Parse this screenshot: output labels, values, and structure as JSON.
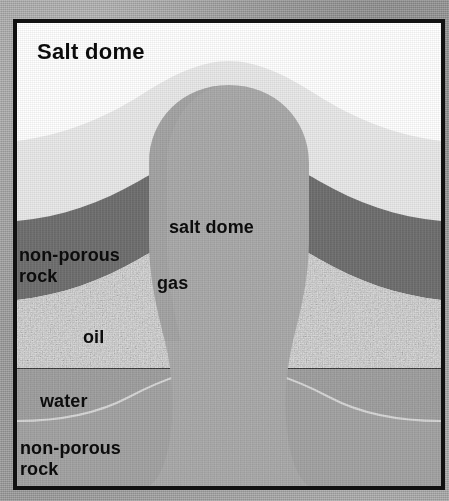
{
  "figure": {
    "title": "Salt dome",
    "caption_position": "top-left-inside-frame",
    "frame_border_color": "#111111",
    "outer_background_color": "#9a9a9a",
    "type": "geological-cross-section"
  },
  "labels": {
    "title": "Salt dome",
    "salt_dome": "salt dome",
    "gas": "gas",
    "oil": "oil",
    "water": "water",
    "non_porous_rock_upper": "non-porous\nrock",
    "non_porous_rock_lower": "non-porous\nrock"
  },
  "strata": [
    {
      "name": "overburden-white",
      "label": "",
      "color": "#ffffff",
      "texture": "smooth",
      "order": 1
    },
    {
      "name": "caprock-light",
      "label": "",
      "color": "#e8e8e8",
      "texture": "smooth",
      "order": 2
    },
    {
      "name": "non-porous-rock-upper",
      "label": "non-porous rock",
      "color": "#6e6e6e",
      "texture": "smooth",
      "order": 3
    },
    {
      "name": "oil-reservoir",
      "label": "oil",
      "color": "#d2d2d2",
      "texture": "speckled-coarse",
      "order": 4
    },
    {
      "name": "water-reservoir",
      "label": "water",
      "color": "#9c9c9c",
      "texture": "fine-grain",
      "order": 5
    },
    {
      "name": "non-porous-rock-lower",
      "label": "non-porous rock",
      "color": "#a2a2a2",
      "texture": "fine-grain",
      "order": 6
    },
    {
      "name": "salt-dome-body",
      "label": "salt dome",
      "color": "#a8a8a8",
      "texture": "fine-grain",
      "order": 7
    },
    {
      "name": "gas-cap",
      "label": "gas",
      "color": "#a8a8a8",
      "texture": "fine-grain",
      "order": 8
    }
  ],
  "colors": {
    "white_layer": "#ffffff",
    "light_layer": "#e8e8e8",
    "dark_band": "#6e6e6e",
    "oil_layer": "#d2d2d2",
    "water_layer": "#9c9c9c",
    "lower_rock": "#a2a2a2",
    "salt_body": "#a8a8a8",
    "text": "#0c0c0c",
    "frame": "#111111",
    "paper": "#9a9a9a"
  }
}
